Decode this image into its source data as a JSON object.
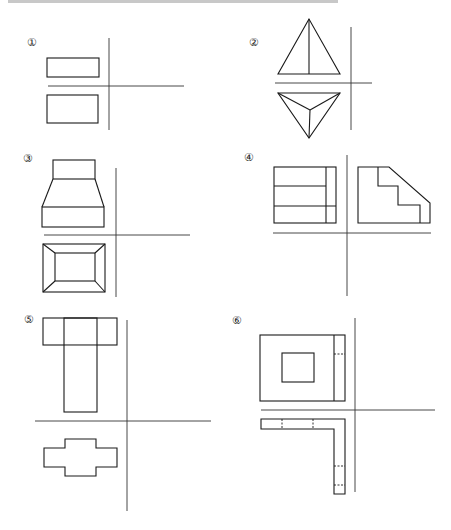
{
  "header": {
    "partial_text": ""
  },
  "figures": [
    {
      "id": 1,
      "label": "①"
    },
    {
      "id": 2,
      "label": "②"
    },
    {
      "id": 3,
      "label": "③"
    },
    {
      "id": 4,
      "label": "④"
    },
    {
      "id": 5,
      "label": "⑤"
    },
    {
      "id": 6,
      "label": "⑥"
    }
  ],
  "colors": {
    "line": "#1a1a1a",
    "axis": "#333333",
    "background": "#ffffff"
  }
}
